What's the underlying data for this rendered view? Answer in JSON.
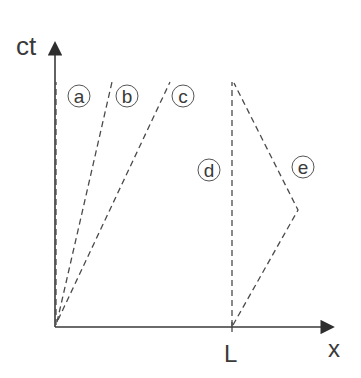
{
  "diagram": {
    "type": "spacetime-diagram",
    "axes": {
      "vertical_label": "ct",
      "horizontal_label": "x",
      "tick_label": "L"
    },
    "worldlines": [
      {
        "id": "a",
        "label": "a",
        "style": "dashed",
        "from": [
          0,
          0
        ],
        "to": [
          0,
          1
        ],
        "description": "stationary at origin"
      },
      {
        "id": "b",
        "label": "b",
        "style": "dashed",
        "from": [
          0,
          0
        ],
        "to": [
          0.32,
          1
        ],
        "description": "slow rightward motion from origin"
      },
      {
        "id": "c",
        "label": "c",
        "style": "dashed",
        "from": [
          0,
          0
        ],
        "to": [
          0.64,
          1
        ],
        "description": "faster rightward motion from origin"
      },
      {
        "id": "d",
        "label": "d",
        "style": "dashed",
        "from": [
          "L",
          0
        ],
        "to": [
          "L",
          1
        ],
        "description": "stationary at x = L"
      },
      {
        "id": "e",
        "label": "e",
        "style": "dashed",
        "from": [
          "L",
          0
        ],
        "via": [
          "L+0.38",
          0.48
        ],
        "to": [
          "L",
          1
        ],
        "description": "moves right from L, then returns to L"
      }
    ],
    "colors": {
      "axis": "#3a3a3a",
      "lines": "#4a4a4a",
      "background": "#ffffff"
    }
  }
}
